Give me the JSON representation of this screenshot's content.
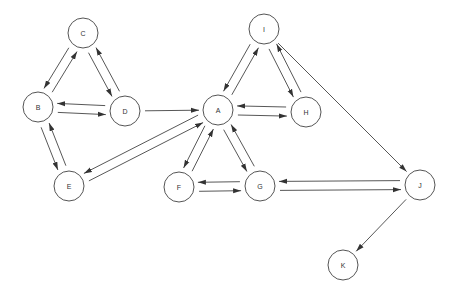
{
  "diagram": {
    "type": "directed-graph",
    "node_radius": 15,
    "colors": {
      "stroke": "#555555",
      "edge": "#444444",
      "label": "#333333",
      "background": "#ffffff"
    },
    "nodes": [
      {
        "id": "C",
        "label": "C",
        "x": 83,
        "y": 33
      },
      {
        "id": "B",
        "label": "B",
        "x": 38,
        "y": 107
      },
      {
        "id": "D",
        "label": "D",
        "x": 125,
        "y": 111
      },
      {
        "id": "E",
        "label": "E",
        "x": 69,
        "y": 186
      },
      {
        "id": "A",
        "label": "A",
        "x": 218,
        "y": 110
      },
      {
        "id": "H",
        "label": "H",
        "x": 306,
        "y": 112
      },
      {
        "id": "I",
        "label": "I",
        "x": 264,
        "y": 29
      },
      {
        "id": "F",
        "label": "F",
        "x": 179,
        "y": 187
      },
      {
        "id": "G",
        "label": "G",
        "x": 260,
        "y": 186
      },
      {
        "id": "J",
        "label": "J",
        "x": 420,
        "y": 185
      },
      {
        "id": "K",
        "label": "K",
        "x": 343,
        "y": 265
      }
    ],
    "edges": [
      {
        "from": "B",
        "to": "C"
      },
      {
        "from": "C",
        "to": "B"
      },
      {
        "from": "C",
        "to": "D"
      },
      {
        "from": "D",
        "to": "C"
      },
      {
        "from": "D",
        "to": "B"
      },
      {
        "from": "B",
        "to": "D"
      },
      {
        "from": "B",
        "to": "E"
      },
      {
        "from": "E",
        "to": "B"
      },
      {
        "from": "D",
        "to": "A"
      },
      {
        "from": "E",
        "to": "A"
      },
      {
        "from": "A",
        "to": "E"
      },
      {
        "from": "A",
        "to": "I"
      },
      {
        "from": "I",
        "to": "A"
      },
      {
        "from": "I",
        "to": "H"
      },
      {
        "from": "H",
        "to": "I"
      },
      {
        "from": "A",
        "to": "H"
      },
      {
        "from": "H",
        "to": "A"
      },
      {
        "from": "A",
        "to": "F"
      },
      {
        "from": "F",
        "to": "A"
      },
      {
        "from": "A",
        "to": "G"
      },
      {
        "from": "G",
        "to": "A"
      },
      {
        "from": "F",
        "to": "G"
      },
      {
        "from": "G",
        "to": "F"
      },
      {
        "from": "I",
        "to": "J"
      },
      {
        "from": "J",
        "to": "G"
      },
      {
        "from": "G",
        "to": "J"
      },
      {
        "from": "J",
        "to": "K"
      }
    ]
  }
}
